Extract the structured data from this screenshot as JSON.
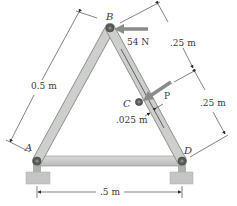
{
  "points": {
    "A": {
      "label": "A",
      "x": 37,
      "y": 161
    },
    "B": {
      "label": "B",
      "x": 110,
      "y": 28
    },
    "C": {
      "label": "C",
      "x": 139,
      "y": 102
    },
    "D": {
      "label": "D",
      "x": 182,
      "y": 161
    }
  },
  "loads": {
    "force_B": {
      "label": "54 N",
      "direction": "left"
    },
    "force_P": {
      "label": "P",
      "direction": "down-left"
    }
  },
  "dimensions": {
    "AB_length": "0.5 m",
    "BC_length": ".25 m",
    "CD_length": ".25 m",
    "BD_offset": ".025 m",
    "AD_span": ".5 m"
  },
  "colors": {
    "member": "#c9cbc8",
    "member_edge": "#8c8e8b",
    "pin": "#5a5c5a",
    "support": "#c4c6c3",
    "arrow": "#8a8c89",
    "line": "#2e2e2e"
  }
}
